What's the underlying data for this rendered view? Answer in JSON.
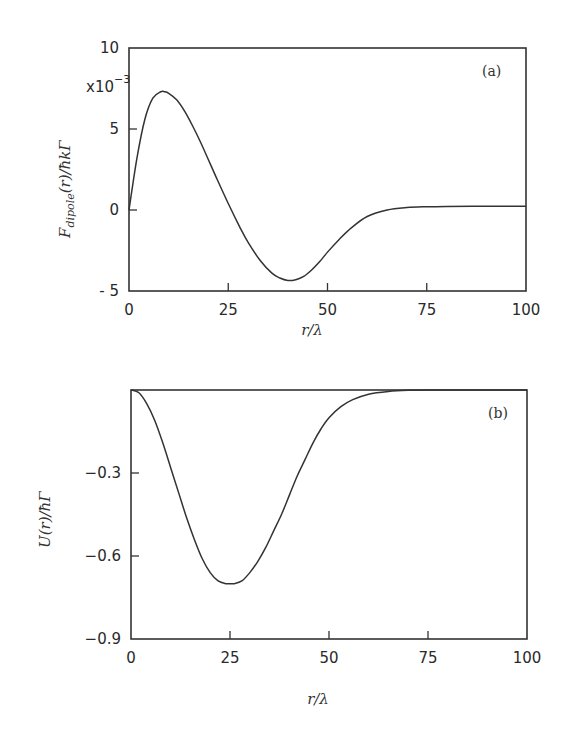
{
  "chart_data": [
    {
      "id": "a",
      "type": "line",
      "panel_label": "(a)",
      "title": "",
      "xlabel": "r/λ",
      "ylabel": "F_dipole(r)/ħkΓ",
      "ylabel_parts": {
        "main": "F",
        "sub": "dipole",
        "rest": "(r)/ħkΓ"
      },
      "y_multiplier": "x10",
      "y_multiplier_exp": "−3",
      "xlim": [
        0,
        100
      ],
      "ylim": [
        -5,
        10
      ],
      "xticks": [
        0,
        25,
        50,
        75,
        100
      ],
      "xtick_labels": [
        "0",
        "25",
        "50",
        "75",
        "100"
      ],
      "yticks": [
        -5,
        0,
        5,
        10
      ],
      "ytick_labels": [
        "- 5",
        "0",
        "5",
        "10"
      ],
      "grid": false,
      "legend": null,
      "series": [
        {
          "name": "F_dipole",
          "x": [
            0,
            2,
            4,
            6,
            8,
            9,
            10,
            12,
            14,
            16,
            18,
            20,
            22,
            25,
            28,
            30,
            33,
            36,
            38,
            40,
            42,
            44,
            46,
            48,
            50,
            53,
            56,
            60,
            65,
            70,
            75,
            80,
            90,
            100
          ],
          "y": [
            0.0,
            3.2,
            5.6,
            6.9,
            7.3,
            7.3,
            7.2,
            6.8,
            6.1,
            5.2,
            4.2,
            3.1,
            2.0,
            0.4,
            -1.1,
            -2.0,
            -3.1,
            -3.9,
            -4.2,
            -4.35,
            -4.3,
            -4.1,
            -3.7,
            -3.2,
            -2.6,
            -1.8,
            -1.1,
            -0.4,
            0.0,
            0.15,
            0.2,
            0.22,
            0.23,
            0.23
          ]
        }
      ]
    },
    {
      "id": "b",
      "type": "line",
      "panel_label": "(b)",
      "title": "",
      "xlabel": "r/λ",
      "ylabel": "U(r)/ħΓ",
      "xlim": [
        0,
        100
      ],
      "ylim": [
        -0.9,
        0
      ],
      "xticks": [
        0,
        25,
        50,
        75,
        100
      ],
      "xtick_labels": [
        "0",
        "25",
        "50",
        "75",
        "100"
      ],
      "yticks": [
        -0.9,
        -0.6,
        -0.3
      ],
      "ytick_labels": [
        "−0.9",
        "−0.6",
        "−0.3"
      ],
      "grid": false,
      "legend": null,
      "series": [
        {
          "name": "U",
          "x": [
            0,
            2,
            4,
            6,
            8,
            10,
            12,
            14,
            16,
            18,
            20,
            22,
            24,
            25,
            26,
            28,
            30,
            32,
            34,
            36,
            38,
            40,
            42,
            44,
            46,
            48,
            50,
            53,
            56,
            60,
            65,
            70,
            75,
            80,
            90,
            100
          ],
          "y": [
            0.0,
            -0.01,
            -0.05,
            -0.11,
            -0.19,
            -0.28,
            -0.37,
            -0.46,
            -0.54,
            -0.61,
            -0.66,
            -0.69,
            -0.7,
            -0.7,
            -0.7,
            -0.69,
            -0.66,
            -0.62,
            -0.57,
            -0.51,
            -0.45,
            -0.38,
            -0.31,
            -0.25,
            -0.19,
            -0.14,
            -0.1,
            -0.06,
            -0.035,
            -0.015,
            -0.005,
            -0.001,
            0.0,
            0.0,
            0.0,
            0.0
          ]
        }
      ]
    }
  ]
}
